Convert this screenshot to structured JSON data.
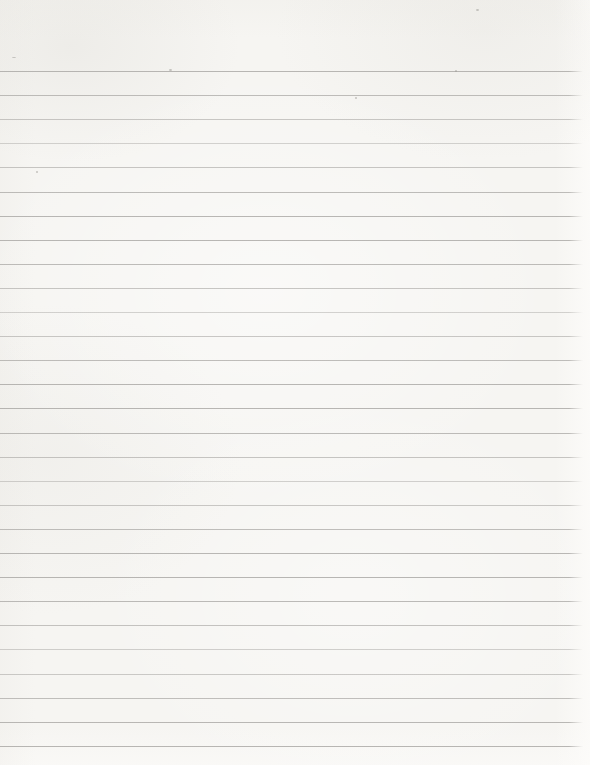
{
  "page": {
    "text_content": "",
    "background_color": "#f6f5f2",
    "line_color": "#a5a3a0",
    "line_count": 29,
    "first_line_top_px": 71,
    "line_spacing_px": 24.1,
    "line_thickness_px": 1,
    "line_length_px": 583,
    "line_right_fade_px": 14,
    "specks": [
      {
        "x": 12,
        "y": 57,
        "w": 4,
        "h": 1
      },
      {
        "x": 169,
        "y": 69,
        "w": 3,
        "h": 2
      },
      {
        "x": 455,
        "y": 70,
        "w": 2,
        "h": 2
      },
      {
        "x": 355,
        "y": 97,
        "w": 2,
        "h": 2
      },
      {
        "x": 36,
        "y": 171,
        "w": 2,
        "h": 2
      },
      {
        "x": 476,
        "y": 9,
        "w": 3,
        "h": 2
      }
    ]
  }
}
